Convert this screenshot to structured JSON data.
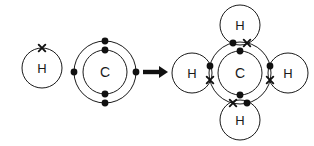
{
  "diagram": {
    "type": "chemical-bonding-diagram",
    "background_color": "#ffffff",
    "stroke_color": "#1a1a1a",
    "electron_dot_color": "#111111",
    "electron_cross_color": "#111111",
    "reaction_arrow": "➤"
  },
  "reactants": {
    "hydrogen": {
      "symbol": "H",
      "center": {
        "x": 42,
        "y": 68
      },
      "radius": 20,
      "electrons": [
        {
          "type": "cross",
          "x": 42,
          "y": 48
        }
      ]
    },
    "carbon": {
      "symbol": "C",
      "center": {
        "x": 105,
        "y": 72
      },
      "inner_radius": 22,
      "outer_radius": 31,
      "inner_electrons": [
        {
          "type": "dot",
          "x": 105,
          "y": 50
        },
        {
          "type": "dot",
          "x": 105,
          "y": 94
        }
      ],
      "outer_electrons": [
        {
          "type": "dot",
          "x": 105,
          "y": 41
        },
        {
          "type": "dot",
          "x": 105,
          "y": 103
        },
        {
          "type": "dot",
          "x": 74,
          "y": 72
        },
        {
          "type": "dot",
          "x": 136,
          "y": 72
        }
      ]
    }
  },
  "arrow": {
    "label": "reacts to form",
    "x1": 143,
    "y1": 72,
    "x2": 168,
    "y2": 72
  },
  "product": {
    "name": "methane",
    "carbon": {
      "symbol": "C",
      "center": {
        "x": 240,
        "y": 73
      },
      "inner_radius": 22,
      "outer_radius": 31,
      "inner_electrons": [
        {
          "type": "dot",
          "x": 240,
          "y": 51
        },
        {
          "type": "dot",
          "x": 240,
          "y": 95
        }
      ]
    },
    "hydrogens": [
      {
        "symbol": "H",
        "position": "top",
        "center": {
          "x": 240,
          "y": 25
        },
        "radius": 20
      },
      {
        "symbol": "H",
        "position": "left",
        "center": {
          "x": 192,
          "y": 73
        },
        "radius": 20
      },
      {
        "symbol": "H",
        "position": "right",
        "center": {
          "x": 288,
          "y": 73
        },
        "radius": 20
      },
      {
        "symbol": "H",
        "position": "bottom",
        "center": {
          "x": 240,
          "y": 120
        },
        "radius": 20
      }
    ],
    "bond_pairs": [
      {
        "bond": "top",
        "dot": {
          "x": 233,
          "y": 43
        },
        "cross": {
          "x": 247,
          "y": 43
        }
      },
      {
        "bond": "left",
        "dot": {
          "x": 210,
          "y": 66
        },
        "cross": {
          "x": 210,
          "y": 80
        }
      },
      {
        "bond": "right",
        "dot": {
          "x": 270,
          "y": 66
        },
        "cross": {
          "x": 270,
          "y": 80
        }
      },
      {
        "bond": "bottom",
        "dot": {
          "x": 247,
          "y": 103
        },
        "cross": {
          "x": 233,
          "y": 103
        }
      }
    ]
  }
}
